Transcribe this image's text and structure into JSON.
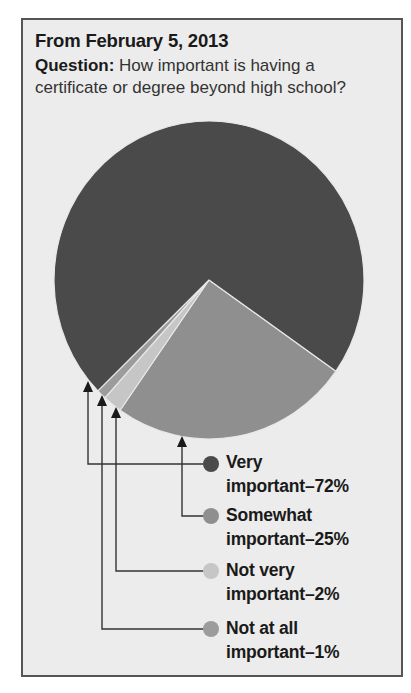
{
  "header": {
    "title": "From February 5, 2013",
    "question_label": "Question:",
    "question_text": " How important is having a certificate or degree beyond high school?"
  },
  "legend": [
    {
      "line1": "Very",
      "line2": "important–72%",
      "color": "#4a4a4a"
    },
    {
      "line1": "Somewhat",
      "line2": "important–25%",
      "color": "#8f8f8f"
    },
    {
      "line1": "Not very",
      "line2": "important–2%",
      "color": "#c6c6c6"
    },
    {
      "line1": "Not at all",
      "line2": "important–1%",
      "color": "#9c9c9c"
    }
  ],
  "chart_data": {
    "type": "pie",
    "title": "From February 5, 2013",
    "subtitle": "Question: How important is having a certificate or degree beyond high school?",
    "categories": [
      "Very important",
      "Somewhat important",
      "Not very important",
      "Not at all important"
    ],
    "values": [
      72,
      25,
      2,
      1
    ],
    "unit": "%",
    "colors": [
      "#4a4a4a",
      "#8f8f8f",
      "#c6c6c6",
      "#9c9c9c"
    ],
    "legend_position": "below-right with arrow connectors"
  }
}
